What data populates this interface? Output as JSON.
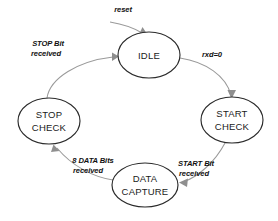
{
  "diagram": {
    "type": "state-transition-diagram",
    "background_color": "#ffffff",
    "node_stroke_color": "#2b2b2b",
    "edge_color": "#9a9a9a",
    "text_color": "#111111",
    "states": [
      {
        "id": "idle",
        "label_line1": "IDLE",
        "label_line2": "",
        "cx": 149,
        "cy": 55,
        "rx": 31,
        "ry": 23
      },
      {
        "id": "start-check",
        "label_line1": "START",
        "label_line2": "CHECK",
        "cx": 232,
        "cy": 120,
        "rx": 31,
        "ry": 23
      },
      {
        "id": "data-capture",
        "label_line1": "DATA",
        "label_line2": "CAPTURE",
        "cx": 145,
        "cy": 185,
        "rx": 33,
        "ry": 22
      },
      {
        "id": "stop-check",
        "label_line1": "STOP",
        "label_line2": "CHECK",
        "cx": 49,
        "cy": 121,
        "rx": 31,
        "ry": 23
      }
    ],
    "transitions": [
      {
        "id": "reset",
        "from": "",
        "to": "idle",
        "label_line1": "reset",
        "label_line2": "",
        "label_x": 123,
        "label_y": 12,
        "label_anchor": "middle"
      },
      {
        "id": "idle-to-start-check",
        "from": "idle",
        "to": "start-check",
        "label_line1": "rxd=0",
        "label_line2": "",
        "label_x": 212,
        "label_y": 57,
        "label_anchor": "middle"
      },
      {
        "id": "start-check-to-data-capture",
        "from": "start-check",
        "to": "data-capture",
        "label_line1": "START Bit",
        "label_line2": "received",
        "label_x": 196,
        "label_y": 166,
        "label_anchor": "middle"
      },
      {
        "id": "data-capture-to-stop-check",
        "from": "data-capture",
        "to": "stop-check",
        "label_line1": "8 DATA Bits",
        "label_line2": "received",
        "label_x": 93,
        "label_y": 163,
        "label_anchor": "middle"
      },
      {
        "id": "stop-check-to-idle",
        "from": "stop-check",
        "to": "idle",
        "label_line1": "STOP Bit",
        "label_line2": "received",
        "label_x": 48,
        "label_y": 46,
        "label_anchor": "middle"
      }
    ]
  }
}
